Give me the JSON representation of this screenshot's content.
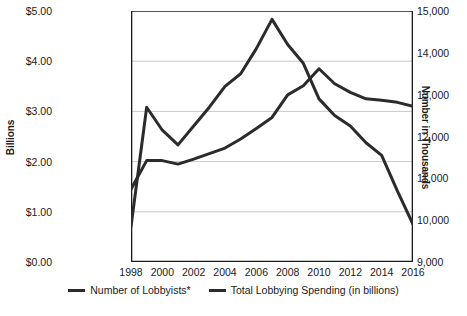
{
  "chart_data": {
    "type": "line",
    "title": "",
    "xlabel": "",
    "ylabel": "Billions",
    "ylabel_right": "Number in Thousands",
    "x": [
      1998,
      1999,
      2000,
      2001,
      2002,
      2003,
      2004,
      2005,
      2006,
      2007,
      2008,
      2009,
      2010,
      2011,
      2012,
      2013,
      2014,
      2015,
      2016
    ],
    "xlim": [
      1998,
      2016
    ],
    "xticks": [
      "1998",
      "2000",
      "2002",
      "2004",
      "2006",
      "2008",
      "2010",
      "2012",
      "2014",
      "2016"
    ],
    "xtick_values": [
      1998,
      2000,
      2002,
      2004,
      2006,
      2008,
      2010,
      2012,
      2014,
      2016
    ],
    "ylim": [
      0,
      5
    ],
    "yticks": [
      "$0.00",
      "$1.00",
      "$2.00",
      "$3.00",
      "$4.00",
      "$5.00"
    ],
    "ytick_values": [
      0,
      1,
      2,
      3,
      4,
      5
    ],
    "ylim_right": [
      9000,
      15000
    ],
    "yticks_right": [
      "9,000",
      "10,000",
      "11,000",
      "12,000",
      "13,000",
      "14,000",
      "15,000"
    ],
    "ytick_values_right": [
      9000,
      10000,
      11000,
      12000,
      13000,
      14000,
      15000
    ],
    "grid": true,
    "legend_position": "bottom",
    "series": [
      {
        "name": "Number of Lobbyists*",
        "axis": "right",
        "color": "#2b2b2b",
        "values": [
          9850,
          12700,
          12150,
          11800,
          12250,
          12700,
          13200,
          13500,
          14100,
          14800,
          14200,
          13750,
          12900,
          12500,
          12250,
          11850,
          11550,
          10700,
          9900
        ]
      },
      {
        "name": "Total Lobbying Spending (in billions)",
        "axis": "left",
        "color": "#2b2b2b",
        "values": [
          1.45,
          2.02,
          2.02,
          1.95,
          2.05,
          2.16,
          2.27,
          2.45,
          2.66,
          2.88,
          3.33,
          3.51,
          3.85,
          3.55,
          3.38,
          3.25,
          3.22,
          3.18,
          3.1
        ]
      }
    ]
  },
  "legend": {
    "items": [
      {
        "label": "Number of Lobbyists*"
      },
      {
        "label": "Total Lobbying Spending (in billions)"
      }
    ]
  },
  "footnote": {
    "text": ""
  }
}
